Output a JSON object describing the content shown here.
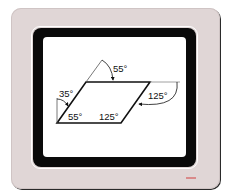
{
  "device": {
    "type": "monitor",
    "bezel_color": "#e0d6d6",
    "frame_color": "#0a0a0a",
    "screen_color": "#ffffff",
    "badge_color": "#d98a8a"
  },
  "diagram": {
    "shape": "parallelogram",
    "angles": {
      "exterior_top": "55°",
      "exterior_left": "35°",
      "interior_bottom_left": "55°",
      "interior_bottom_right": "125°",
      "exterior_right": "125°"
    }
  }
}
